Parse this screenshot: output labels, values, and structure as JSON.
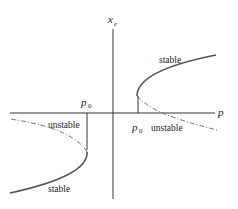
{
  "diagram": {
    "type": "bifurcation-diagram",
    "axes": {
      "x_label": "p",
      "y_label": "x",
      "y_label_subscript": "e"
    },
    "marks": {
      "right_parameter": {
        "symbol": "p",
        "subscript": "0"
      },
      "left_parameter": {
        "symbol": "p",
        "subscript": "0"
      }
    },
    "branches": {
      "upper_right_stable": {
        "label": "stable",
        "style": "solid"
      },
      "lower_right_unstable": {
        "label": "unstable",
        "style": "dash-dot"
      },
      "upper_left_unstable": {
        "label": "unstable",
        "style": "dash-dot"
      },
      "lower_left_stable": {
        "label": "stable",
        "style": "solid"
      }
    },
    "colors": {
      "axis": "#333333",
      "stable_curve": "#555555",
      "unstable_curve": "#777777",
      "text": "#222222"
    }
  }
}
